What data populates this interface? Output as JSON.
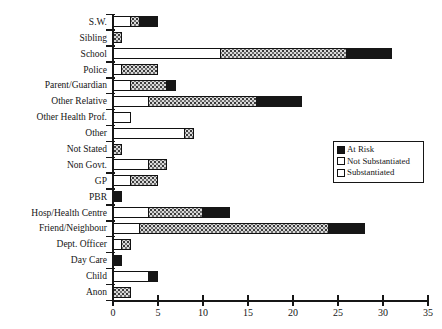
{
  "chart_data": {
    "type": "bar",
    "orientation": "horizontal",
    "stacked": true,
    "title": "",
    "xlabel": "",
    "ylabel": "",
    "grid": false,
    "categories": [
      "S.W.",
      "Sibling",
      "School",
      "Police",
      "Parent/Guardian",
      "Other Relative",
      "Other Health Prof.",
      "Other",
      "Not Stated",
      "Non Govt.",
      "GP",
      "PBR",
      "Hosp/Health Centre",
      "Friend/Neighbour",
      "Dept. Officer",
      "Day Care",
      "Child",
      "Anon"
    ],
    "series": [
      {
        "name": "Substantiated",
        "style": "substantiated",
        "values": [
          2,
          0,
          12,
          1,
          2,
          4,
          2,
          8,
          0,
          4,
          2,
          0,
          4,
          3,
          1,
          0,
          4,
          0
        ]
      },
      {
        "name": "Not Substantiated",
        "style": "not_substantiated",
        "values": [
          1,
          1,
          14,
          4,
          4,
          12,
          0,
          1,
          1,
          2,
          3,
          0,
          6,
          21,
          1,
          0,
          0,
          2
        ]
      },
      {
        "name": "At Risk",
        "style": "at_risk",
        "values": [
          2,
          0,
          5,
          0,
          1,
          5,
          0,
          0,
          0,
          0,
          0,
          1,
          3,
          4,
          0,
          1,
          1,
          0
        ]
      }
    ],
    "x_axis": {
      "min": 0,
      "max": 35,
      "ticks": [
        0,
        5,
        10,
        15,
        20,
        25,
        30,
        35
      ]
    },
    "legend": {
      "position": "middle-right",
      "entries": [
        {
          "label": "At Risk",
          "style": "at_risk"
        },
        {
          "label": "Not Substantiated",
          "style": "not_substantiated"
        },
        {
          "label": "Substantiated",
          "style": "substantiated"
        }
      ]
    },
    "colors": {
      "at_risk": "#161616",
      "not_substantiated": "#d9d9d9",
      "substantiated": "#ffffff",
      "axis": "#161616",
      "background": "#ffffff"
    }
  }
}
